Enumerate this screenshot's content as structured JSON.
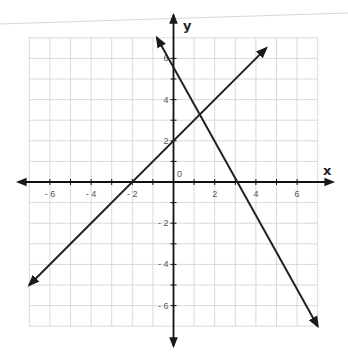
{
  "chart_data": {
    "type": "line",
    "title": "",
    "xlabel": "x",
    "ylabel": "y",
    "origin_label": "0",
    "xlim": [
      -7,
      7
    ],
    "ylim": [
      -7,
      7
    ],
    "grid": true,
    "x_ticks": [
      -6,
      -4,
      -2,
      2,
      4,
      6
    ],
    "y_ticks": [
      -6,
      -4,
      -2,
      2,
      4,
      6
    ],
    "series": [
      {
        "name": "line-increasing",
        "equation": "y = x + 2",
        "slope": 1,
        "intercept": 2,
        "x_intercept": -2,
        "points": [
          [
            -7,
            -5
          ],
          [
            -2,
            0
          ],
          [
            0,
            2
          ],
          [
            4.5,
            6.5
          ]
        ]
      },
      {
        "name": "line-decreasing",
        "equation": "y = -5/3 x + 5",
        "slope": -1.6667,
        "intercept": 5,
        "x_intercept": 3,
        "points": [
          [
            -0.8,
            7
          ],
          [
            0,
            5
          ],
          [
            3,
            0
          ],
          [
            7,
            -7
          ]
        ]
      }
    ],
    "intersection": [
      1.1,
      3.1
    ],
    "colors": {
      "lines": "#222222",
      "grid": "#cfcfcf",
      "axes": "#111111"
    }
  }
}
